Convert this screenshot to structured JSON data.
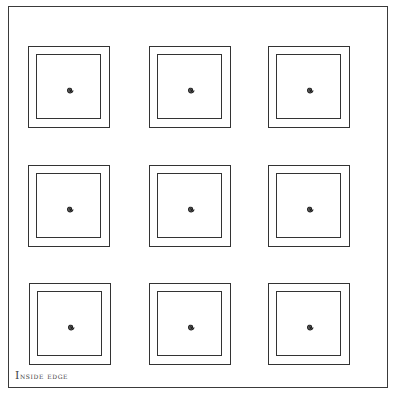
{
  "diagram": {
    "label": "Inside edge",
    "grid": {
      "rows": 3,
      "columns": 3
    },
    "cells": [
      {
        "row": 1,
        "col": 1,
        "x": 28,
        "y": 46,
        "mark": "spiral-icon"
      },
      {
        "row": 1,
        "col": 2,
        "x": 149,
        "y": 46,
        "mark": "spiral-icon"
      },
      {
        "row": 1,
        "col": 3,
        "x": 268,
        "y": 46,
        "mark": "spiral-icon"
      },
      {
        "row": 2,
        "col": 1,
        "x": 28,
        "y": 165,
        "mark": "spiral-icon"
      },
      {
        "row": 2,
        "col": 2,
        "x": 149,
        "y": 165,
        "mark": "spiral-icon"
      },
      {
        "row": 2,
        "col": 3,
        "x": 268,
        "y": 165,
        "mark": "spiral-icon"
      },
      {
        "row": 3,
        "col": 1,
        "x": 29,
        "y": 283,
        "mark": "spiral-icon"
      },
      {
        "row": 3,
        "col": 2,
        "x": 149,
        "y": 283,
        "mark": "spiral-icon"
      },
      {
        "row": 3,
        "col": 3,
        "x": 268,
        "y": 283,
        "mark": "spiral-icon"
      }
    ],
    "colors": {
      "line": "#333333",
      "background": "#ffffff",
      "label": "#444444"
    }
  }
}
